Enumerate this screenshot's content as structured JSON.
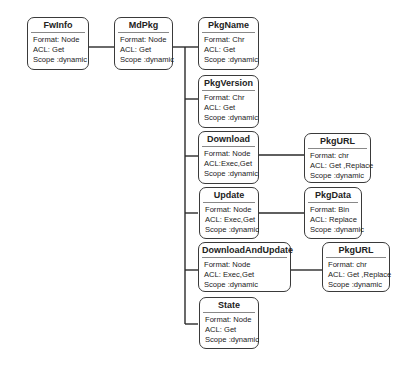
{
  "diagram": {
    "nodes": {
      "fwinfo": {
        "name": "FwInfo",
        "format": "Format: Node",
        "acl": "ACL: Get",
        "scope": "Scope :dynamic"
      },
      "mdpkg": {
        "name": "MdPkg",
        "format": "Format: Node",
        "acl": "ACL: Get",
        "scope": "Scope :dynamic"
      },
      "pkgname": {
        "name": "PkgName",
        "format": "Format: Chr",
        "acl": "ACL: Get",
        "scope": "Scope :dynamic"
      },
      "pkgversion": {
        "name": "PkgVersion",
        "format": "Format: Chr",
        "acl": "ACL: Get",
        "scope": "Scope :dynamic"
      },
      "download": {
        "name": "Download",
        "format": "Format: Node",
        "acl": "ACL:Exec,Get",
        "scope": "Scope :dynamic"
      },
      "pkgurl1": {
        "name": "PkgURL",
        "format": "Format: chr",
        "acl": "ACL: Get ,Replace",
        "scope": "Scope :dynamic"
      },
      "update": {
        "name": "Update",
        "format": "Format: Node",
        "acl": "ACL: Exec,Get",
        "scope": "Scope :dynamic"
      },
      "pkgdata": {
        "name": "PkgData",
        "format": "Format: Bin",
        "acl": "ACL: Replace",
        "scope": "Scope :dynamic"
      },
      "downloadandupdate": {
        "name": "DownloadAndUpdate",
        "format": "Format: Node",
        "acl": "ACL: Exec,Get",
        "scope": "Scope :dynamic"
      },
      "pkgurl2": {
        "name": "PkgURL",
        "format": "Format: chr",
        "acl": "ACL: Get ,Replace",
        "scope": "Scope :dynamic"
      },
      "state": {
        "name": "State",
        "format": "Format: Node",
        "acl": "ACL: Get",
        "scope": "Scope :dynamic"
      }
    },
    "edges": [
      [
        "FwInfo",
        "MdPkg"
      ],
      [
        "MdPkg",
        "PkgName"
      ],
      [
        "MdPkg",
        "PkgVersion"
      ],
      [
        "MdPkg",
        "Download"
      ],
      [
        "MdPkg",
        "Update"
      ],
      [
        "MdPkg",
        "DownloadAndUpdate"
      ],
      [
        "MdPkg",
        "State"
      ],
      [
        "Download",
        "PkgURL"
      ],
      [
        "Update",
        "PkgData"
      ],
      [
        "DownloadAndUpdate",
        "PkgURL"
      ]
    ]
  }
}
